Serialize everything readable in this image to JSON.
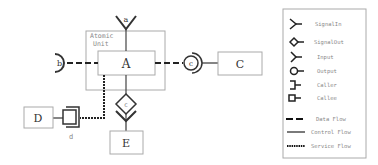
{
  "diagram": {
    "atomic_unit_label_line1": "Atomic",
    "atomic_unit_label_line2": "Unit",
    "nodes": {
      "A": "A",
      "C": "C",
      "D": "D",
      "E": "E"
    },
    "ports": {
      "a": "a",
      "b": "b",
      "c_right": "c",
      "c_bottom": "c",
      "d": "d"
    }
  },
  "legend": {
    "items": [
      {
        "icon": "signal-in-icon",
        "label": "SignalIn"
      },
      {
        "icon": "signal-out-icon",
        "label": "SignalOut"
      },
      {
        "icon": "input-icon",
        "label": "Input"
      },
      {
        "icon": "output-icon",
        "label": "Output"
      },
      {
        "icon": "caller-icon",
        "label": "Caller"
      },
      {
        "icon": "callee-icon",
        "label": "Callee"
      }
    ],
    "flows": [
      {
        "icon": "data-flow-line",
        "label": "Data Flow"
      },
      {
        "icon": "control-flow-line",
        "label": "Control Flow"
      },
      {
        "icon": "service-flow-line",
        "label": "Service Flow"
      }
    ]
  },
  "colors": {
    "box_border": "#aaaaaa",
    "line": "#333333",
    "legend_text": "#888888"
  }
}
